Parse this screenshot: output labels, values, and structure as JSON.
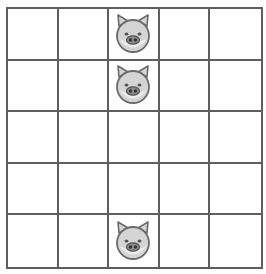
{
  "board": {
    "rows": 5,
    "cols": 5,
    "grid_color": "#5f5f5f",
    "background": "#ffffff",
    "cells": [
      [
        "",
        "",
        "pig",
        "",
        ""
      ],
      [
        "",
        "",
        "pig",
        "",
        ""
      ],
      [
        "",
        "",
        "",
        "",
        ""
      ],
      [
        "",
        "",
        "",
        "",
        ""
      ],
      [
        "",
        "",
        "pig",
        "",
        ""
      ]
    ]
  },
  "pieces": [
    {
      "type": "pig-icon",
      "row": 0,
      "col": 2
    },
    {
      "type": "pig-icon",
      "row": 1,
      "col": 2
    },
    {
      "type": "pig-icon",
      "row": 4,
      "col": 2
    }
  ],
  "colors": {
    "pig_face": "#d4d4d4",
    "pig_outline": "#6a6a6a",
    "pig_snout": "#8a8a8a"
  }
}
